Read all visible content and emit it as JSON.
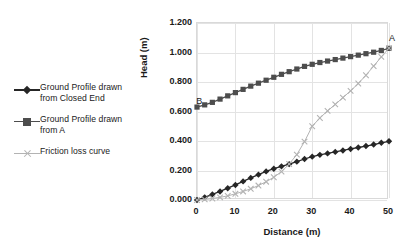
{
  "chart_data": {
    "type": "line",
    "title": "",
    "xlabel": "Distance (m)",
    "ylabel": "Head (m)",
    "xlim": [
      0,
      50
    ],
    "ylim": [
      0.0,
      1.2
    ],
    "grid": true,
    "legend_position": "left",
    "xticks": [
      "0",
      "10",
      "20",
      "30",
      "40",
      "50"
    ],
    "xtick_values": [
      0,
      10,
      20,
      30,
      40,
      50
    ],
    "yticks": [
      "0.000",
      "0.200",
      "0.400",
      "0.600",
      "0.800",
      "1.000",
      "1.200"
    ],
    "ytick_values": [
      0.0,
      0.2,
      0.4,
      0.6,
      0.8,
      1.0,
      1.2
    ],
    "x": [
      0,
      2,
      4,
      6,
      8,
      10,
      12,
      14,
      16,
      18,
      20,
      22,
      24,
      26,
      28,
      30,
      32,
      34,
      36,
      38,
      40,
      42,
      44,
      46,
      48,
      50
    ],
    "series": [
      {
        "name": "Ground Profile drawn from Closed End",
        "marker": "diamond",
        "color": "#262626",
        "values": [
          0.0,
          0.018,
          0.038,
          0.058,
          0.08,
          0.102,
          0.126,
          0.15,
          0.172,
          0.194,
          0.212,
          0.228,
          0.243,
          0.26,
          0.278,
          0.294,
          0.306,
          0.316,
          0.326,
          0.336,
          0.346,
          0.356,
          0.366,
          0.376,
          0.388,
          0.398
        ]
      },
      {
        "name": "Ground Profile drawn from A",
        "marker": "square",
        "color": "#4d4d4d",
        "values": [
          0.63,
          0.645,
          0.662,
          0.684,
          0.706,
          0.728,
          0.75,
          0.772,
          0.792,
          0.812,
          0.832,
          0.852,
          0.87,
          0.888,
          0.906,
          0.92,
          0.932,
          0.942,
          0.952,
          0.962,
          0.972,
          0.982,
          0.992,
          1.002,
          1.014,
          1.028
        ]
      },
      {
        "name": "Friction loss curve",
        "marker": "x",
        "color": "#b3b3b3",
        "values": [
          0.0,
          0.004,
          0.01,
          0.018,
          0.028,
          0.042,
          0.058,
          0.076,
          0.098,
          0.124,
          0.154,
          0.192,
          0.244,
          0.308,
          0.396,
          0.5,
          0.556,
          0.604,
          0.648,
          0.694,
          0.74,
          0.79,
          0.846,
          0.908,
          0.97,
          1.03
        ]
      }
    ],
    "annotations": [
      {
        "text": "B",
        "x": 0.6,
        "y": 0.665
      },
      {
        "text": "A",
        "x": 50.8,
        "y": 1.09
      }
    ]
  },
  "legend": {
    "items": [
      {
        "label_line1": "Ground Profile drawn",
        "label_line2": "from Closed End",
        "marker": "diamond",
        "color": "#262626"
      },
      {
        "label_line1": "Ground Profile drawn",
        "label_line2": "from A",
        "marker": "square",
        "color": "#4d4d4d"
      },
      {
        "label_line1": "Friction loss curve",
        "label_line2": "",
        "marker": "x",
        "color": "#b3b3b3"
      }
    ]
  },
  "colors": {
    "background": "#ffffff",
    "grid": "#e3e3e3",
    "frame": "#d9d9d9",
    "text": "#1a1a1a"
  }
}
